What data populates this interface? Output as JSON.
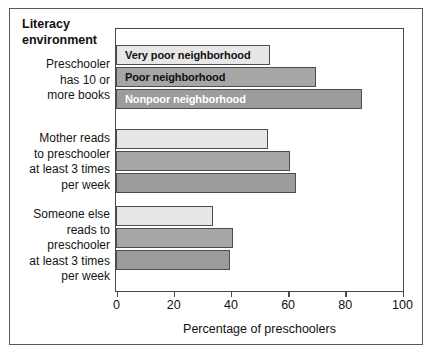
{
  "figure": {
    "title": "Literacy\nenvironment"
  },
  "chart_data": {
    "type": "bar",
    "orientation": "horizontal",
    "title": "Literacy environment",
    "xlabel": "Percentage of preschoolers",
    "ylabel": "",
    "xlim": [
      0,
      100
    ],
    "xticks": [
      0,
      20,
      40,
      60,
      80,
      100
    ],
    "grid": false,
    "legend": "inline-bar-labels",
    "categories": [
      "Preschooler\nhas 10 or\nmore books",
      "Mother reads\nto preschooler\nat least 3 times\nper week",
      "Someone else\nreads to\npreschooler\nat least 3 times\nper week"
    ],
    "series": [
      {
        "name": "Very poor neighborhood",
        "color": "#e7e7e7",
        "text_color": "#111111",
        "values": [
          54,
          53,
          34
        ]
      },
      {
        "name": "Poor neighborhood",
        "color": "#a6a6a6",
        "text_color": "#111111",
        "values": [
          70,
          61,
          41
        ]
      },
      {
        "name": "Nonpoor neighborhood",
        "color": "#9c9c9c",
        "text_color": "#ffffff",
        "values": [
          86,
          63,
          40
        ]
      }
    ]
  },
  "axis": {
    "tick_labels": [
      "0",
      "20",
      "40",
      "60",
      "80",
      "100"
    ],
    "x_axis_title": "Percentage of preschoolers"
  }
}
